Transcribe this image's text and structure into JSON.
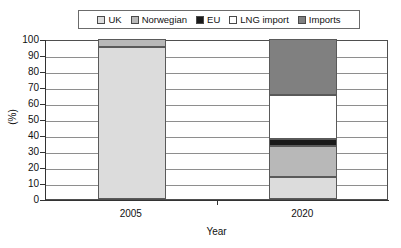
{
  "chart_data": {
    "type": "bar",
    "subtype": "stacked-bar-100",
    "title": "",
    "xlabel": "Year",
    "ylabel": "(%)",
    "ylim": [
      0,
      100
    ],
    "ytick_step": 10,
    "yticks": [
      100,
      90,
      80,
      70,
      60,
      50,
      40,
      30,
      20,
      10,
      0
    ],
    "categories": [
      "2005",
      "2020"
    ],
    "grid": true,
    "legend_position": "top",
    "series": [
      {
        "name": "UK",
        "values": [
          95,
          14
        ],
        "color": "#dcdcdc"
      },
      {
        "name": "Norwegian",
        "values": [
          5,
          19
        ],
        "color": "#b8b8b8"
      },
      {
        "name": "EU",
        "values": [
          0,
          4.5
        ],
        "color": "#1a1a1a"
      },
      {
        "name": "LNG import",
        "values": [
          0,
          27.5
        ],
        "color": "#ffffff"
      },
      {
        "name": "Imports",
        "values": [
          0,
          35
        ],
        "color": "#808080"
      }
    ]
  },
  "legend": {
    "items": [
      {
        "label": "UK"
      },
      {
        "label": "Norwegian"
      },
      {
        "label": "EU"
      },
      {
        "label": "LNG import"
      },
      {
        "label": "Imports"
      }
    ]
  },
  "axes": {
    "y": {
      "title": "(%)",
      "ticks": [
        "100",
        "90",
        "80",
        "70",
        "60",
        "50",
        "40",
        "30",
        "20",
        "10",
        "0"
      ]
    },
    "x": {
      "title": "Year",
      "ticks": [
        "2005",
        "2020"
      ]
    }
  }
}
